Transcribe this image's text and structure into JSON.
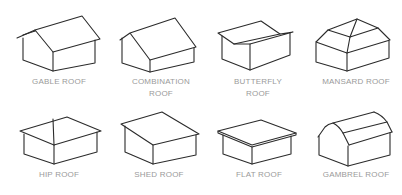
{
  "colors": {
    "line": "#2b2b2b",
    "label": "#9a9a9a",
    "background": "#ffffff"
  },
  "roofs": [
    {
      "id": "gable",
      "label_line1": "GABLE ROOF",
      "label_line2": ""
    },
    {
      "id": "combination",
      "label_line1": "COMBINATION",
      "label_line2": "ROOF"
    },
    {
      "id": "butterfly",
      "label_line1": "BUTTERFLY",
      "label_line2": "ROOF"
    },
    {
      "id": "mansard",
      "label_line1": "MANSARD ROOF",
      "label_line2": ""
    },
    {
      "id": "hip",
      "label_line1": "HIP ROOF",
      "label_line2": ""
    },
    {
      "id": "shed",
      "label_line1": "SHED ROOF",
      "label_line2": ""
    },
    {
      "id": "flat",
      "label_line1": "FLAT ROOF",
      "label_line2": ""
    },
    {
      "id": "gambrel",
      "label_line1": "GAMBREL ROOF",
      "label_line2": ""
    }
  ]
}
